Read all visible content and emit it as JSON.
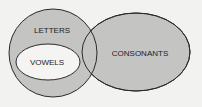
{
  "diagram": {
    "type": "venn",
    "background": "#f2f2f0",
    "fill_gray": "#c4c4c2",
    "fill_white": "#f4f4f2",
    "stroke": "#2a2a2a",
    "sets": [
      {
        "id": "letters",
        "label": "LETTERS"
      },
      {
        "id": "vowels",
        "label": "VOWELS",
        "subset_of": "letters"
      },
      {
        "id": "consonants",
        "label": "CONSONANTS",
        "overlaps": "letters"
      }
    ]
  }
}
